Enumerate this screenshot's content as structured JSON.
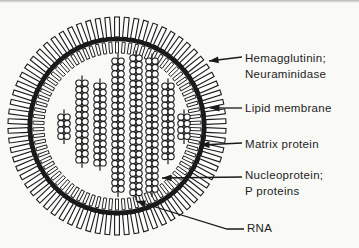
{
  "figure": {
    "title_semantic": "Influenza virus structure diagram",
    "ink_color": "#1a1a1a",
    "paper_color": "#f9f9f6",
    "labels": [
      {
        "id": "hemagglutinin-neuraminidase",
        "lines": [
          "Hemagglutinin;",
          "Neuraminidase"
        ]
      },
      {
        "id": "lipid-membrane",
        "lines": [
          "Lipid membrane"
        ]
      },
      {
        "id": "matrix-protein",
        "lines": [
          "Matrix protein"
        ]
      },
      {
        "id": "nucleoprotein-p-proteins",
        "lines": [
          "Nucleoprotein;",
          "P proteins"
        ]
      },
      {
        "id": "rna",
        "lines": [
          "RNA"
        ]
      }
    ],
    "arrows": [
      {
        "part": "surface-spikes",
        "points": [
          [
            242,
            57
          ],
          [
            209,
            61
          ]
        ]
      },
      {
        "part": "lipid-membrane",
        "points": [
          [
            242,
            108
          ],
          [
            210,
            108
          ]
        ]
      },
      {
        "part": "matrix-protein",
        "points": [
          [
            242,
            143
          ],
          [
            200,
            145
          ]
        ]
      },
      {
        "part": "nucleoprotein",
        "points": [
          [
            242,
            177
          ],
          [
            162,
            178
          ]
        ]
      },
      {
        "part": "rna-strand",
        "points": [
          [
            244,
            229
          ],
          [
            227,
            229
          ],
          [
            136,
            201
          ]
        ]
      }
    ],
    "arrow_head": {
      "length": 9.5,
      "half_width": 3.4
    },
    "virus": {
      "cx": 117,
      "cy": 126,
      "spikes": {
        "count": 70,
        "r_outer": 109,
        "r_inner": 89,
        "width": 4.8
      },
      "membrane": {
        "r": 87,
        "stroke_width": 4.6
      },
      "matrix": {
        "count": 78,
        "r_outer": 84,
        "r_inner": 73,
        "width": 3
      },
      "bead": {
        "radius": 3.1,
        "pitch": 6.4,
        "line_overhang": 4.5
      },
      "chains": [
        {
          "x": 64,
          "top": 114,
          "pairs": 4
        },
        {
          "x": 82,
          "top": 80,
          "pairs": 13
        },
        {
          "x": 100,
          "top": 83,
          "pairs": 13
        },
        {
          "x": 118,
          "top": 58,
          "pairs": 21
        },
        {
          "x": 136,
          "top": 55,
          "pairs": 22
        },
        {
          "x": 152,
          "top": 58,
          "pairs": 21
        },
        {
          "x": 168,
          "top": 83,
          "pairs": 12
        },
        {
          "x": 184,
          "top": 114,
          "pairs": 4
        }
      ]
    }
  }
}
